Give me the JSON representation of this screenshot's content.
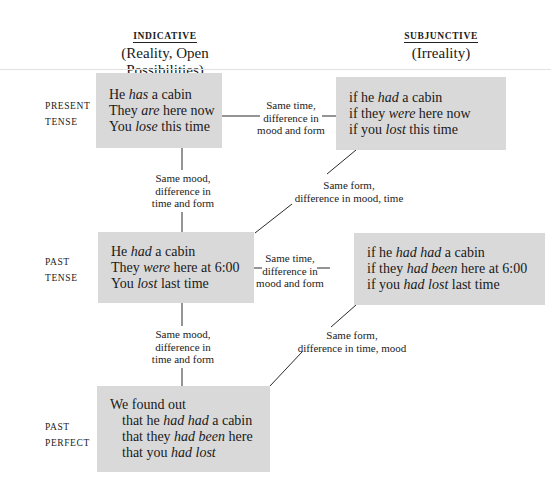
{
  "columns": {
    "indicative": {
      "title": "INDICATIVE",
      "subtitle_line1": "(Reality, Open",
      "subtitle_line2": "Possibilities)"
    },
    "subjunctive": {
      "title": "SUBJUNCTIVE",
      "subtitle_line1": "(Irreality)"
    }
  },
  "rows": {
    "present": {
      "label_line1": "PRESENT",
      "label_line2": "TENSE"
    },
    "past": {
      "label_line1": "PAST",
      "label_line2": "TENSE"
    },
    "past_perfect": {
      "label_line1": "PAST",
      "label_line2": "PERFECT"
    }
  },
  "boxes": {
    "present_indicative": [
      {
        "pre": "He ",
        "em": "has",
        "post": " a cabin"
      },
      {
        "pre": "They ",
        "em": "are",
        "post": " here now"
      },
      {
        "pre": "You ",
        "em": "lose",
        "post": " this time"
      }
    ],
    "present_subjunctive": [
      {
        "pre": "if he ",
        "em": "had",
        "post": " a cabin"
      },
      {
        "pre": "if they ",
        "em": "were",
        "post": " here now"
      },
      {
        "pre": "if you ",
        "em": "lost",
        "post": " this time"
      }
    ],
    "past_indicative": [
      {
        "pre": "He ",
        "em": "had",
        "post": " a cabin"
      },
      {
        "pre": "They ",
        "em": "were",
        "post": " here at 6:00"
      },
      {
        "pre": "You ",
        "em": "lost",
        "post": " last time"
      }
    ],
    "past_subjunctive": [
      {
        "pre": "if he ",
        "em": "had had",
        "post": " a cabin"
      },
      {
        "pre": "if they ",
        "em": "had been",
        "post": " here at 6:00"
      },
      {
        "pre": "if you ",
        "em": "had lost",
        "post": " last time"
      }
    ],
    "past_perfect": [
      {
        "pre": "We found out",
        "em": "",
        "post": ""
      },
      {
        "pre": "that he ",
        "em": "had had",
        "post": " a cabin"
      },
      {
        "pre": "that they ",
        "em": "had been",
        "post": " here"
      },
      {
        "pre": "that you ",
        "em": "had lost",
        "post": ""
      }
    ]
  },
  "notes": {
    "present_horizontal": [
      "Same time,",
      "difference in",
      "mood and form"
    ],
    "present_to_past_vertical": [
      "Same mood,",
      "difference in",
      "time and form"
    ],
    "present_diagonal": [
      "Same form,",
      "difference in mood, time"
    ],
    "past_horizontal": [
      "Same time,",
      "difference in",
      "mood and form"
    ],
    "past_to_perfect_vertical": [
      "Same mood,",
      "difference in",
      "time and form"
    ],
    "past_diagonal": [
      "Same form,",
      "difference in time, mood"
    ]
  },
  "colors": {
    "box_fill": "#d9d9d9",
    "rule": "#e2e2e2",
    "text": "#1a1a1a"
  }
}
